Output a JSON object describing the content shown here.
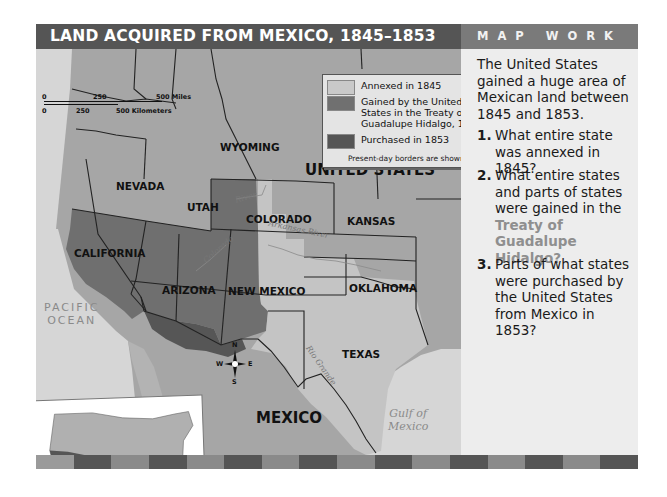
{
  "title": "LAND ACQUIRED FROM MEXICO, 1845–1853",
  "panel": {
    "heading": "MAP WORK",
    "intro": "The United States gained a huge area of Mexican land between 1845 and 1853.",
    "questions": [
      {
        "number": "1.",
        "text": "What entire state was annexed in 1845?"
      },
      {
        "number": "2.",
        "text_before": "What entire states and parts of states were gained in the ",
        "highlight": "Treaty of Guadalupe Hidalgo?"
      },
      {
        "number": "3.",
        "text": "Parts of what states were purchased by the United States from Mexico in 1853?"
      }
    ]
  },
  "legend": {
    "items": [
      {
        "label": "Annexed in 1845",
        "color": "#c9c9c9"
      },
      {
        "label": "Gained by the United States in the Treaty of Guadalupe Hidalgo, 1848",
        "color": "#707070"
      },
      {
        "label": "Purchased in 1853",
        "color": "#555555"
      }
    ],
    "note": "Present-day borders are shown."
  },
  "scale": {
    "miles": {
      "start": "0",
      "mid": "250",
      "end": "500 Miles"
    },
    "km": {
      "start": "0",
      "mid": "250",
      "end": "500 Kilometers"
    }
  },
  "map_labels": {
    "states": {
      "wyoming": "WYOMING",
      "nevada": "NEVADA",
      "utah": "UTAH",
      "colorado": "COLORADO",
      "kansas": "KANSAS",
      "california": "CALIFORNIA",
      "arizona": "ARIZONA",
      "new_mexico": "NEW MEXICO",
      "oklahoma": "OKLAHOMA",
      "texas": "TEXAS"
    },
    "countries": {
      "us": "UNITED STATES",
      "mexico": "MEXICO"
    },
    "water": {
      "pacific": "PACIFIC OCEAN",
      "pacific_line1": "PACIFIC",
      "pacific_line2": "OCEAN",
      "gulf_line1": "Gulf of",
      "gulf_line2": "Mexico"
    },
    "rivers": {
      "colorado": "Colorado",
      "river": "River",
      "arkansas": "Arkansas River",
      "rio_grande": "Rio Grande"
    }
  },
  "compass": {
    "n": "N",
    "s": "S",
    "e": "E",
    "w": "W"
  },
  "colors": {
    "title_bg": "#555555",
    "panel_head_bg": "#7a7a7a",
    "panel_bg": "#ededed",
    "us_land": "#a9a9a9",
    "annexed": "#c9c9c9",
    "gained": "#707070",
    "purchased": "#555555",
    "water": "#d9d9d9",
    "highlight_text": "#8f8f8f"
  },
  "stripe": [
    "#9a9a9a",
    "#555555",
    "#8a8a8a",
    "#555555",
    "#8a8a8a",
    "#555555",
    "#8a8a8a",
    "#555555",
    "#8a8a8a",
    "#555555",
    "#8a8a8a",
    "#555555",
    "#8a8a8a",
    "#555555",
    "#8a8a8a",
    "#555555"
  ]
}
